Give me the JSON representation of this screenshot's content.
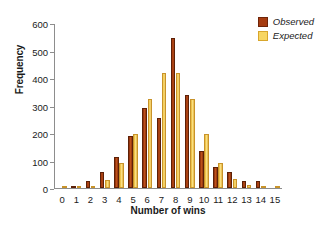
{
  "chart_data": {
    "type": "bar",
    "title": "",
    "xlabel": "Number of wins",
    "ylabel": "Frequency",
    "categories": [
      "0",
      "1",
      "2",
      "3",
      "4",
      "5",
      "6",
      "7",
      "8",
      "9",
      "10",
      "11",
      "12",
      "13",
      "14",
      "15"
    ],
    "series": [
      {
        "name": "Observed",
        "color": "#a63c10",
        "values": [
          0,
          7,
          24,
          57,
          115,
          192,
          291,
          257,
          550,
          340,
          136,
          76,
          58,
          24,
          25,
          0
        ]
      },
      {
        "name": "Expected",
        "color": "#f7d663",
        "values": [
          1,
          2,
          8,
          30,
          90,
          197,
          325,
          420,
          420,
          326,
          198,
          92,
          33,
          11,
          2,
          4
        ]
      }
    ],
    "ylim": [
      0,
      600
    ],
    "yticks": [
      0,
      100,
      200,
      300,
      400,
      500,
      600
    ],
    "ytick_labels": [
      "0",
      "100",
      "200",
      "300",
      "400",
      "500",
      "600"
    ],
    "grid": false,
    "legend_position": "top-right",
    "legend_entries": [
      "Observed",
      "Expected"
    ]
  }
}
